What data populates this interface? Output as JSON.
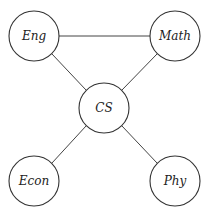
{
  "diagram": {
    "type": "undirected-graph",
    "nodes": [
      {
        "id": "eng",
        "label": "Eng",
        "x": 34,
        "y": 36
      },
      {
        "id": "math",
        "label": "Math",
        "x": 175,
        "y": 36
      },
      {
        "id": "cs",
        "label": "CS",
        "x": 104,
        "y": 108
      },
      {
        "id": "econ",
        "label": "Econ",
        "x": 34,
        "y": 181
      },
      {
        "id": "phy",
        "label": "Phy",
        "x": 175,
        "y": 181
      }
    ],
    "edges": [
      {
        "from": "eng",
        "to": "math"
      },
      {
        "from": "eng",
        "to": "cs"
      },
      {
        "from": "math",
        "to": "cs"
      },
      {
        "from": "cs",
        "to": "econ"
      },
      {
        "from": "cs",
        "to": "phy"
      }
    ],
    "node_radius": 25
  }
}
